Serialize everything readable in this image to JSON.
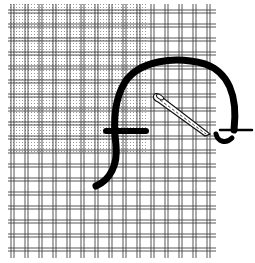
{
  "figure": {
    "caption": "",
    "colors": {
      "background": "#ffffff",
      "thread": "#444444",
      "stipple": "#9a9a9a",
      "yarn": "#000000",
      "needle_outline": "#111111"
    },
    "canvas": {
      "left": 8,
      "top": 4,
      "right": 216,
      "bottom": 258,
      "spacing": 14,
      "thread_gap": 3,
      "first_vertical_x": 11,
      "first_horizontal_y": 10
    },
    "shaded_region": {
      "x": 8,
      "y": 4,
      "w": 140,
      "h": 150
    },
    "elements": {
      "yarn": "thick-yarn-stitch",
      "needle": "needle",
      "tail": "yarn-tail"
    }
  }
}
